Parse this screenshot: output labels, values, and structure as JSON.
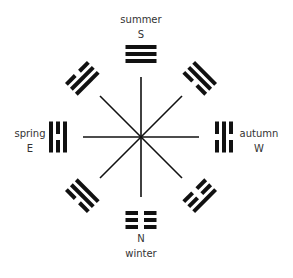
{
  "diagram": {
    "title": "",
    "center": [
      141,
      137
    ],
    "colors": {
      "ink": "#111111",
      "text": "#333333",
      "background": "#ffffff"
    },
    "labels": {
      "south_season": "summer",
      "south_dir": "S",
      "north_season": "winter",
      "north_dir": "N",
      "east_season": "spring",
      "east_dir": "E",
      "west_season": "autumn",
      "west_dir": "W"
    },
    "trigrams": [
      {
        "position": "S",
        "angle": 0,
        "lines_outer_to_inner": [
          "solid",
          "solid",
          "solid"
        ]
      },
      {
        "position": "N",
        "angle": 180,
        "lines_outer_to_inner": [
          "broken",
          "broken",
          "broken"
        ]
      },
      {
        "position": "E",
        "angle": 270,
        "lines_outer_to_inner": [
          "solid",
          "broken",
          "solid"
        ]
      },
      {
        "position": "W",
        "angle": 90,
        "lines_outer_to_inner": [
          "broken",
          "solid",
          "broken"
        ]
      },
      {
        "position": "NW",
        "angle": 315,
        "lines_outer_to_inner": [
          "broken",
          "solid",
          "solid"
        ]
      },
      {
        "position": "NE",
        "angle": 45,
        "lines_outer_to_inner": [
          "solid",
          "solid",
          "broken"
        ]
      },
      {
        "position": "SW",
        "angle": 225,
        "lines_outer_to_inner": [
          "broken",
          "solid",
          "solid"
        ]
      },
      {
        "position": "SE",
        "angle": 135,
        "lines_outer_to_inner": [
          "solid",
          "broken",
          "broken"
        ]
      }
    ]
  }
}
